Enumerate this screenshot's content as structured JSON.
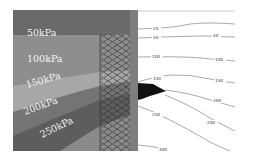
{
  "figure": {
    "left_panel": {
      "description": "Pressure bands with reinforced mesh zone",
      "bands": [
        {
          "label": "50kPa",
          "color": "#6c6c6c"
        },
        {
          "label": "100kPa",
          "color": "#8d8d8d"
        },
        {
          "label": "150kPa",
          "color": "#a9a9a9"
        },
        {
          "label": "200kPa",
          "color": "#727272"
        },
        {
          "label": "250kPa",
          "color": "#5e5e5e"
        }
      ],
      "mesh_color": "#3a3a3a"
    },
    "right_panel": {
      "description": "Pressure contour lines",
      "contour_labels": [
        {
          "id": "c25",
          "text": "25"
        },
        {
          "id": "c50a",
          "text": "50"
        },
        {
          "id": "c50b",
          "text": "50"
        },
        {
          "id": "c100a",
          "text": "100"
        },
        {
          "id": "c100b",
          "text": "100"
        },
        {
          "id": "c150a",
          "text": "150"
        },
        {
          "id": "c150b",
          "text": "150"
        },
        {
          "id": "c200a",
          "text": "200"
        },
        {
          "id": "c200b",
          "text": "200"
        },
        {
          "id": "c250",
          "text": "250"
        },
        {
          "id": "c300",
          "text": "300"
        }
      ],
      "line_color": "#555555",
      "wedge_color": "#111111"
    }
  }
}
